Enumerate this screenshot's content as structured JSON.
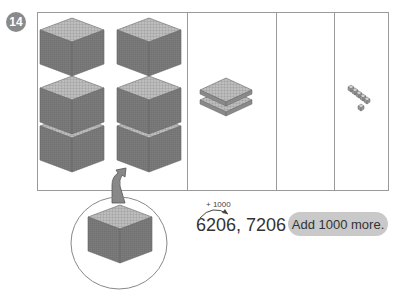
{
  "problem": {
    "number": "14",
    "columns": [
      {
        "name": "thousands",
        "blocks": 6,
        "block_type": "thousand-cube"
      },
      {
        "name": "hundreds",
        "blocks": 2,
        "block_type": "hundred-flat"
      },
      {
        "name": "tens",
        "blocks": 0,
        "block_type": "ten-rod"
      },
      {
        "name": "ones",
        "blocks": 6,
        "block_type": "unit-cube"
      }
    ],
    "added_block": "thousand-cube",
    "arrow_label": "+ 1000",
    "sequence": "6206, 7206",
    "hint": "Add 1000 more."
  },
  "colors": {
    "badge": "#8a8a8a",
    "pill": "#c9c9c9",
    "block": "#9a9a9a",
    "border": "#9a9a9a"
  }
}
